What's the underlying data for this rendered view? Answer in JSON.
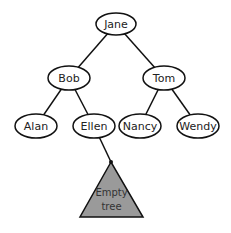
{
  "diagram": {
    "type": "binary-tree",
    "colors": {
      "stroke": "#111111",
      "node_fill": "#ffffff",
      "empty_tree_fill": "#9a9a9a",
      "background": "#ffffff"
    },
    "nodes": [
      {
        "id": "jane",
        "label": "Jane",
        "cx": 116,
        "cy": 24,
        "rx": 20,
        "ry": 11
      },
      {
        "id": "bob",
        "label": "Bob",
        "cx": 69,
        "cy": 78,
        "rx": 21,
        "ry": 12
      },
      {
        "id": "tom",
        "label": "Tom",
        "cx": 164,
        "cy": 78,
        "rx": 21,
        "ry": 12
      },
      {
        "id": "alan",
        "label": "Alan",
        "cx": 36,
        "cy": 126,
        "rx": 21,
        "ry": 12
      },
      {
        "id": "ellen",
        "label": "Ellen",
        "cx": 94,
        "cy": 126,
        "rx": 21,
        "ry": 12
      },
      {
        "id": "nancy",
        "label": "Nancy",
        "cx": 140,
        "cy": 126,
        "rx": 21,
        "ry": 12
      },
      {
        "id": "wendy",
        "label": "Wendy",
        "cx": 198,
        "cy": 126,
        "rx": 21,
        "ry": 12
      }
    ],
    "edges": [
      {
        "from": "jane",
        "to": "bob"
      },
      {
        "from": "jane",
        "to": "tom"
      },
      {
        "from": "bob",
        "to": "alan"
      },
      {
        "from": "bob",
        "to": "ellen"
      },
      {
        "from": "tom",
        "to": "nancy"
      },
      {
        "from": "tom",
        "to": "wendy"
      },
      {
        "from": "ellen",
        "to": "empty-tree"
      }
    ],
    "empty_tree": {
      "label_line1": "Empty",
      "label_line2": "tree",
      "apex": [
        111,
        162
      ],
      "base_left": [
        80,
        217
      ],
      "base_right": [
        143,
        217
      ]
    }
  }
}
